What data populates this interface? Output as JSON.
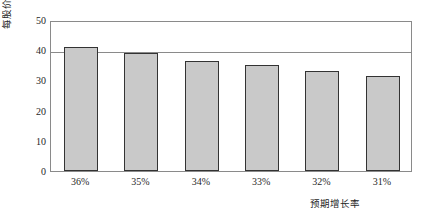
{
  "chart_data": {
    "type": "bar",
    "title": "",
    "subtitle": "",
    "xlabel": "预期增长率",
    "ylabel": "每股价值(美元)",
    "categories": [
      "36%",
      "35%",
      "34%",
      "33%",
      "32%",
      "31%"
    ],
    "values": [
      41,
      39,
      36.5,
      35,
      33,
      31.5
    ],
    "series": [
      {
        "name": "每股价值(美元)",
        "values": [
          41,
          39,
          36.5,
          35,
          33,
          31.5
        ]
      }
    ],
    "ylim": [
      0,
      50
    ],
    "y_ticks": [
      "0",
      "10",
      "20",
      "30",
      "40",
      "50"
    ],
    "y_tick_values": [
      0,
      10,
      20,
      30,
      40,
      50
    ],
    "gridlines": [
      40,
      50
    ],
    "grid": true,
    "legend": "none",
    "legend_position": "none",
    "annotations": [],
    "colors": {
      "bar_fill": "#c9c9c9",
      "bar_border": "#333333",
      "axis": "#8a8a8a",
      "text": "#1f1f1f",
      "background": "#ffffff"
    }
  }
}
